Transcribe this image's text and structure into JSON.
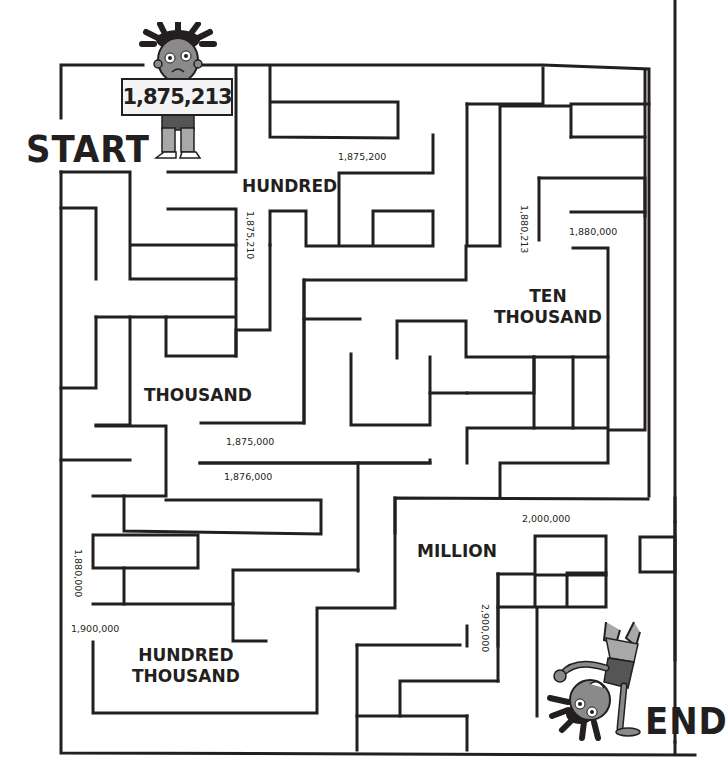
{
  "labels": {
    "start": "START",
    "end": "END"
  },
  "sign": {
    "number": "1,875,213"
  },
  "zones": {
    "hundred": "HUNDRED",
    "thousand": "THOUSAND",
    "ten_thousand_line1": "TEN",
    "ten_thousand_line2": "THOUSAND",
    "hundred_thousand_line1": "HUNDRED",
    "hundred_thousand_line2": "THOUSAND",
    "million": "MILLION"
  },
  "numbers": {
    "n_1875200": "1,875,200",
    "n_1875210": "1,875,210",
    "n_1880213": "1,880,213",
    "n_1880000_top": "1,880,000",
    "n_1875000": "1,875,000",
    "n_1876000": "1,876,000",
    "n_1880000_left": "1,880,000",
    "n_1900000": "1,900,000",
    "n_2000000": "2,000,000",
    "n_2900000": "2,900,000"
  },
  "characters": {
    "start_kid": "child-holding-sign",
    "end_kid": "child-doing-handstand"
  },
  "colors": {
    "ink": "#231f20",
    "skin": "#8a8a8a",
    "shirt": "#555555",
    "pants": "#a8a8a8",
    "background": "#ffffff"
  }
}
